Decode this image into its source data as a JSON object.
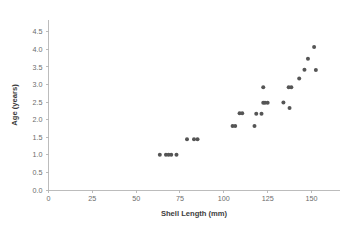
{
  "chart_data": {
    "type": "scatter",
    "title": "",
    "xlabel": "Shell Length (mm)",
    "ylabel": "Age (years)",
    "xlim": [
      0,
      160
    ],
    "ylim": [
      0.0,
      4.75
    ],
    "xticks": [
      0,
      25,
      50,
      75,
      100,
      125,
      150
    ],
    "xtick_labels": [
      "0",
      "25",
      "50",
      "75",
      "100",
      "125",
      "150"
    ],
    "yticks": [
      0.0,
      0.5,
      1.0,
      1.5,
      2.0,
      2.5,
      3.0,
      3.5,
      4.0,
      4.5
    ],
    "ytick_labels": [
      "0.0",
      "0.5",
      "1.0",
      "1.5",
      "2.0",
      "2.5",
      "3.0",
      "3.5",
      "4.0",
      "4.5"
    ],
    "grid": false,
    "legend": false,
    "marker_color": "#555555",
    "axis_color": "#b5b5b5",
    "label_color": "#3d3d3d",
    "tick_color": "#6b6b6b",
    "series": [
      {
        "name": "specimens",
        "x": [
          63.5,
          67.0,
          68.5,
          70.0,
          73.0,
          79.0,
          83.0,
          85.0,
          105.0,
          106.5,
          109.0,
          110.5,
          117.5,
          118.5,
          121.5,
          122.5,
          123.5,
          125.0,
          122.5,
          134.0,
          137.0,
          138.5,
          137.5,
          143.0,
          146.0,
          148.0,
          151.5,
          152.5
        ],
        "y": [
          1.0,
          1.0,
          1.0,
          1.0,
          1.0,
          1.44,
          1.44,
          1.44,
          1.82,
          1.82,
          2.18,
          2.18,
          1.82,
          2.17,
          2.17,
          2.48,
          2.48,
          2.48,
          2.92,
          2.49,
          2.92,
          2.92,
          2.33,
          3.17,
          3.42,
          3.73,
          4.07,
          3.41
        ]
      }
    ]
  },
  "axis_titles": {
    "x": "Shell Length (mm)",
    "y": "Age (years)"
  }
}
